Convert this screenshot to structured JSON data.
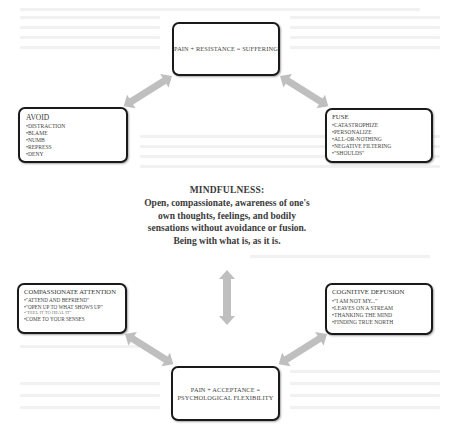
{
  "diagram": {
    "top_box": {
      "label": "PAIN + RESISTANCE = SUFFERING"
    },
    "avoid_box": {
      "title": "AVOID",
      "items": [
        "DISTRACTION",
        "BLAME",
        "NUMB",
        "REPRESS",
        "DENY"
      ]
    },
    "fuse_box": {
      "title": "FUSE",
      "items": [
        "CATASTROPHIZE",
        "PERSONALIZE",
        "ALL-OR-NOTHING",
        "NEGATIVE FILTERING",
        "\"SHOULDS\""
      ]
    },
    "mindfulness": {
      "heading": "MINDFULNESS:",
      "lines": [
        "Open, compassionate, awareness of one's",
        "own thoughts, feelings, and bodily",
        "sensations without avoidance or fusion.",
        "Being with what is, as it is."
      ]
    },
    "compassionate_box": {
      "title": "COMPASSIONATE ATTENTION",
      "items": [
        "\"ATTEND AND BEFRIEND\"",
        "\"OPEN UP TO WHAT SHOWS UP\"",
        "\"FEEL IT TO HEAL IT\"",
        "COME TO YOUR SENSES"
      ]
    },
    "defusion_box": {
      "title": "COGNITIVE DEFUSION",
      "items": [
        "\"I AM NOT MY...\"",
        "LEAVES ON A STREAM",
        "THANKING THE MIND",
        "FINDING TRUE NORTH"
      ]
    },
    "bottom_box": {
      "line1": "PAIN + ACCEPTANCE =",
      "line2": "PSYCHOLOGICAL FLEXIBILITY"
    },
    "colors": {
      "arrow": "#bfbfbf",
      "box_border": "#1a1a1a",
      "text": "#333333"
    },
    "arrows": [
      {
        "from": "top_box",
        "to": "avoid_box",
        "type": "double-headed"
      },
      {
        "from": "top_box",
        "to": "fuse_box",
        "type": "double-headed"
      },
      {
        "from": "mindfulness",
        "to": "bottom_box",
        "type": "double-headed-vertical"
      },
      {
        "from": "compassionate_box",
        "to": "bottom_box",
        "type": "double-headed"
      },
      {
        "from": "defusion_box",
        "to": "bottom_box",
        "type": "double-headed"
      }
    ]
  }
}
